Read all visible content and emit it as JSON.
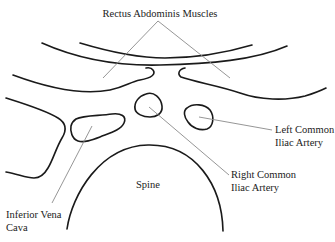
{
  "diagram": {
    "labels": {
      "rectus": "Rectus Abdominis Muscles",
      "left_iliac_line1": "Left Common",
      "left_iliac_line2": "Iliac Artery",
      "right_iliac_line1": "Right Common",
      "right_iliac_line2": "Iliac Artery",
      "spine": "Spine",
      "ivc_line1": "Inferior Vena",
      "ivc_line2": "Cava"
    },
    "colors": {
      "outline": "#1a1a1a",
      "leader": "#8a8a8a",
      "text": "#222222",
      "background": "#ffffff"
    },
    "structures": [
      "rectus-abdominis-muscles",
      "right-common-iliac-artery",
      "left-common-iliac-artery",
      "inferior-vena-cava",
      "spine"
    ]
  }
}
